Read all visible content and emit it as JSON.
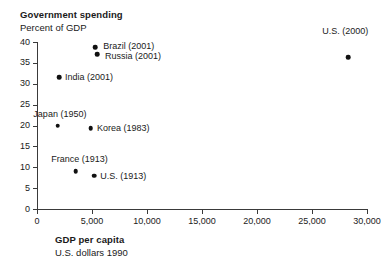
{
  "chart_data": {
    "type": "scatter",
    "title": "Government spending",
    "subtitle": "Percent of GDP",
    "xlabel": "GDP per capita",
    "xlabel_sub": "U.S. dollars 1990",
    "ylabel": "Government spending",
    "ylabel_sub": "Percent of GDP",
    "xlim": [
      0,
      30000
    ],
    "ylim": [
      0,
      40
    ],
    "grid": false,
    "legend": "none",
    "xticks": [
      0,
      5000,
      10000,
      15000,
      20000,
      25000,
      30000
    ],
    "xtick_labels": [
      "0",
      "5,000",
      "10,000",
      "15,000",
      "20,000",
      "25,000",
      "30,000"
    ],
    "yticks": [
      0,
      5,
      10,
      15,
      20,
      25,
      30,
      35,
      40
    ],
    "ytick_labels": [
      "0",
      "5",
      "10",
      "15",
      "20",
      "25",
      "30",
      "35",
      "40"
    ],
    "points": [
      {
        "label": "Brazil (2001)",
        "x": 5300,
        "y": 38.8,
        "label_pos": "right",
        "label_dx": 8,
        "label_dy": -1
      },
      {
        "label": "Russia (2001)",
        "x": 5450,
        "y": 37.1,
        "label_pos": "right",
        "label_dx": 8,
        "label_dy": 2
      },
      {
        "label": "U.S. (2000)",
        "x": 28300,
        "y": 36.3,
        "label_pos": "above",
        "label_dx": -3,
        "label_dy": 21
      },
      {
        "label": "India (2001)",
        "x": 2000,
        "y": 31.5,
        "label_pos": "right",
        "label_dx": 6,
        "label_dy": 0
      },
      {
        "label": "Japan (1950)",
        "x": 1900,
        "y": 20.0,
        "label_pos": "above",
        "label_dx": 2,
        "label_dy": 7
      },
      {
        "label": "Korea (1983)",
        "x": 4900,
        "y": 19.3,
        "label_pos": "right",
        "label_dx": 6,
        "label_dy": 0
      },
      {
        "label": "France (1913)",
        "x": 3500,
        "y": 9.0,
        "label_pos": "above",
        "label_dx": 4,
        "label_dy": 7
      },
      {
        "label": "U.S. (1913)",
        "x": 5200,
        "y": 8.0,
        "label_pos": "right",
        "label_dx": 6,
        "label_dy": 0
      }
    ]
  },
  "colors": {
    "point": "#111111",
    "axis": "#3a3a3a",
    "text": "#1a1a1a",
    "background": "#ffffff"
  }
}
